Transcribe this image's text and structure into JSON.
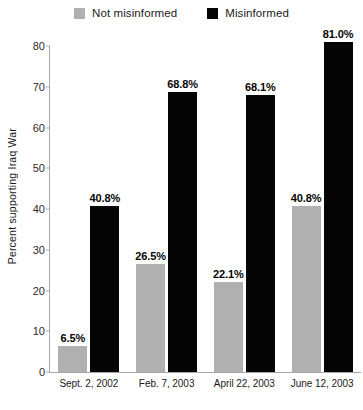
{
  "chart_data": {
    "type": "bar",
    "title": "",
    "xlabel": "",
    "ylabel": "Percent supporting Iraq War",
    "ylim": [
      0,
      80
    ],
    "yticks": [
      0,
      10,
      20,
      30,
      40,
      50,
      60,
      70,
      80
    ],
    "grid": false,
    "legend_position": "top-center",
    "categories": [
      "Sept. 2, 2002",
      "Feb. 7, 2003",
      "April 22, 2003",
      "June 12, 2003"
    ],
    "series": [
      {
        "name": "Not misinformed",
        "color": "#b0b0b0",
        "values": [
          6.5,
          26.5,
          22.1,
          40.8
        ],
        "labels": [
          "6.5%",
          "26.5%",
          "22.1%",
          "40.8%"
        ]
      },
      {
        "name": "Misinformed",
        "color": "#050505",
        "values": [
          40.8,
          68.8,
          68.1,
          81.0
        ],
        "labels": [
          "40.8%",
          "68.8%",
          "68.1%",
          "81.0%"
        ]
      }
    ]
  },
  "legend": {
    "items": [
      {
        "label": "Not misinformed",
        "color": "#b0b0b0",
        "swatch_name": "legend-swatch-not-misinformed"
      },
      {
        "label": "Misinformed",
        "color": "#050505",
        "swatch_name": "legend-swatch-misinformed"
      }
    ]
  },
  "axes": {
    "y_title": "Percent supporting Iraq War",
    "y_tick_labels": [
      "80",
      "70",
      "60",
      "50",
      "40",
      "30",
      "20",
      "10",
      "0"
    ],
    "x_tick_labels": [
      "Sept. 2, 2002",
      "Feb. 7, 2003",
      "April 22, 2003",
      "June 12, 2003"
    ]
  }
}
